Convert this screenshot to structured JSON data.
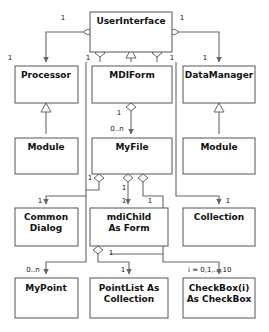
{
  "diagram": {
    "kind": "uml-class-diagram",
    "title": "",
    "background_color": "#ffffff",
    "box_stroke_color": "#555555",
    "edge_color": "#666666",
    "text_color": "#111111",
    "classes": [
      {
        "id": "userinterface",
        "name": "UserInterface",
        "lines": [
          "UserInterface"
        ],
        "x": 90,
        "y": 12,
        "w": 82,
        "h": 40
      },
      {
        "id": "processor",
        "name": "Processor",
        "lines": [
          "Processor"
        ],
        "x": 15,
        "y": 66,
        "w": 63,
        "h": 37
      },
      {
        "id": "mdiform",
        "name": "MDIForm",
        "lines": [
          "MDIForm"
        ],
        "x": 92,
        "y": 66,
        "w": 80,
        "h": 37
      },
      {
        "id": "datamanager",
        "name": "DataManager",
        "lines": [
          "DataManager"
        ],
        "x": 183,
        "y": 66,
        "w": 72,
        "h": 37
      },
      {
        "id": "module-left",
        "name": "Module",
        "lines": [
          "Module"
        ],
        "x": 15,
        "y": 138,
        "w": 63,
        "h": 36
      },
      {
        "id": "myfile",
        "name": "MyFile",
        "lines": [
          "MyFile"
        ],
        "x": 92,
        "y": 138,
        "w": 80,
        "h": 36
      },
      {
        "id": "module-right",
        "name": "Module",
        "lines": [
          "Module"
        ],
        "x": 183,
        "y": 138,
        "w": 72,
        "h": 36
      },
      {
        "id": "commondialog",
        "name": "Common Dialog",
        "lines": [
          "Common",
          "Dialog"
        ],
        "x": 15,
        "y": 208,
        "w": 63,
        "h": 38
      },
      {
        "id": "mdichild",
        "name": "mdiChild As Form",
        "lines": [
          "mdiChild",
          "As Form"
        ],
        "x": 90,
        "y": 208,
        "w": 78,
        "h": 38
      },
      {
        "id": "collection",
        "name": "Collection",
        "lines": [
          "Collection"
        ],
        "x": 183,
        "y": 208,
        "w": 72,
        "h": 38
      },
      {
        "id": "mypoint",
        "name": "MyPoint",
        "lines": [
          "MyPoint"
        ],
        "x": 15,
        "y": 278,
        "w": 63,
        "h": 40
      },
      {
        "id": "pointlist",
        "name": "PointList As Collection",
        "lines": [
          "PointList As",
          "Collection"
        ],
        "x": 90,
        "y": 278,
        "w": 78,
        "h": 40
      },
      {
        "id": "checkbox",
        "name": "CheckBox(i) As CheckBox",
        "lines": [
          "CheckBox(i)",
          "As CheckBox"
        ],
        "x": 183,
        "y": 278,
        "w": 72,
        "h": 40
      }
    ],
    "multiplicities": [
      {
        "id": "m1",
        "text": "1",
        "x": 63,
        "y": 20
      },
      {
        "id": "m2",
        "text": "1",
        "x": 182,
        "y": 20
      },
      {
        "id": "m3",
        "text": "1",
        "x": 10,
        "y": 60
      },
      {
        "id": "m4",
        "text": "1",
        "x": 88,
        "y": 60
      },
      {
        "id": "m5",
        "text": "1",
        "x": 172,
        "y": 60
      },
      {
        "id": "m6",
        "text": "1",
        "x": 205,
        "y": 60
      },
      {
        "id": "m7",
        "text": "1",
        "x": 119,
        "y": 115
      },
      {
        "id": "m8",
        "text": "0..n",
        "x": 117,
        "y": 131
      },
      {
        "id": "m9",
        "text": "1",
        "x": 90,
        "y": 180
      },
      {
        "id": "m10",
        "text": "1",
        "x": 124,
        "y": 190
      },
      {
        "id": "m11",
        "text": "1",
        "x": 124,
        "y": 203
      },
      {
        "id": "m12",
        "text": "1",
        "x": 150,
        "y": 203
      },
      {
        "id": "m13",
        "text": "1",
        "x": 40,
        "y": 203
      },
      {
        "id": "m14",
        "text": "1",
        "x": 228,
        "y": 203
      },
      {
        "id": "m15",
        "text": "1",
        "x": 111,
        "y": 255
      },
      {
        "id": "m16",
        "text": "0..n",
        "x": 33,
        "y": 272
      },
      {
        "id": "m17",
        "text": "1",
        "x": 123,
        "y": 272
      },
      {
        "id": "m18",
        "text": "i = 0,1,...,10",
        "x": 212,
        "y": 272
      }
    ]
  }
}
